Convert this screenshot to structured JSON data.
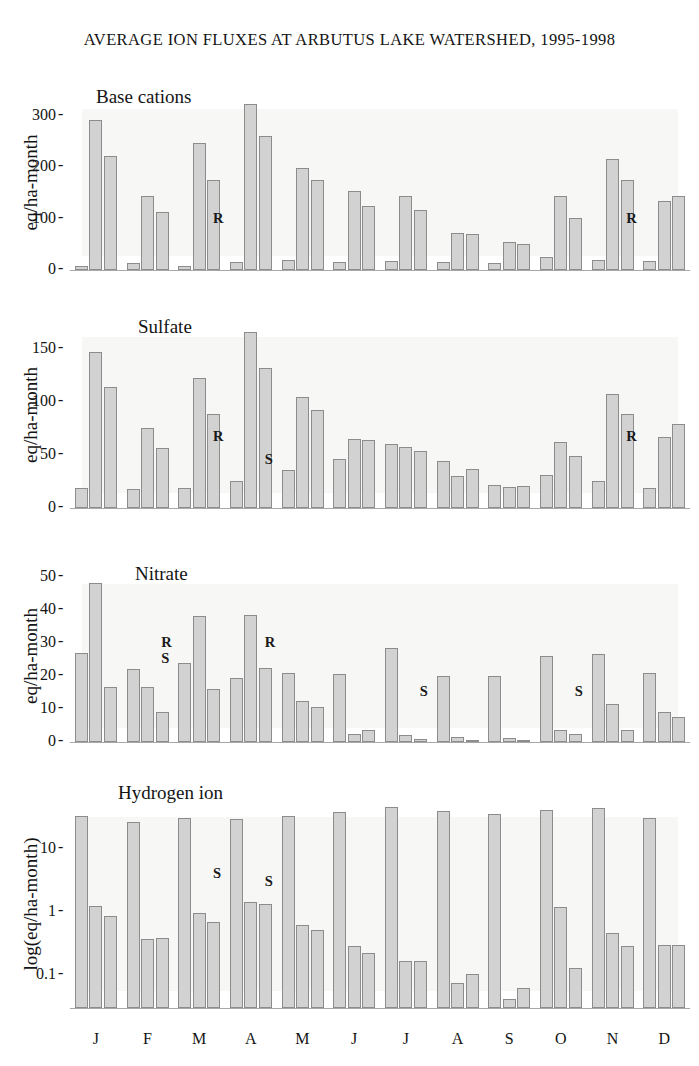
{
  "figure": {
    "title": "AVERAGE ION FLUXES AT ARBUTUS LAKE WATERSHED, 1995-1998",
    "months": [
      "J",
      "F",
      "M",
      "A",
      "M",
      "J",
      "J",
      "A",
      "S",
      "O",
      "N",
      "D"
    ],
    "series_names": [
      "Precipitation",
      "Throughfall",
      "Streamwater"
    ],
    "bar_fill": "#d2d2d2",
    "bar_stroke": "#8c8c8c",
    "shade_color": "#f1f0ee"
  },
  "chart_data": [
    {
      "type": "bar",
      "title": "Base cations",
      "ylabel": "eq/ha-month",
      "xlabel": "",
      "scale": "linear",
      "ylim": [
        0,
        340
      ],
      "yticks": [
        0,
        100,
        200,
        300
      ],
      "ytick_labels": [
        "0",
        "100",
        "200",
        "300"
      ],
      "categories": [
        "J",
        "F",
        "M",
        "A",
        "M",
        "J",
        "J",
        "A",
        "S",
        "O",
        "N",
        "D"
      ],
      "series": [
        {
          "name": "bar1",
          "values": [
            8,
            14,
            8,
            15,
            19,
            16,
            18,
            15,
            14,
            25,
            19,
            18
          ]
        },
        {
          "name": "bar2",
          "values": [
            292,
            143,
            246,
            322,
            199,
            154,
            144,
            71,
            54,
            143,
            216,
            134
          ]
        },
        {
          "name": "bar3",
          "values": [
            221,
            112,
            174,
            260,
            175,
            124,
            116,
            70,
            50,
            102,
            174,
            143
          ]
        }
      ],
      "annotations": [
        {
          "text": "R",
          "category": "M",
          "value": 100
        },
        {
          "text": "R",
          "category": "N",
          "value": 100
        }
      ],
      "grid": false,
      "legend": "none"
    },
    {
      "type": "bar",
      "title": "Sulfate",
      "ylabel": "eq/ha-month",
      "xlabel": "",
      "scale": "linear",
      "ylim": [
        0,
        175
      ],
      "yticks": [
        0,
        50,
        100,
        150
      ],
      "ytick_labels": [
        "0",
        "50",
        "100",
        "150"
      ],
      "categories": [
        "J",
        "F",
        "M",
        "A",
        "M",
        "J",
        "J",
        "A",
        "S",
        "O",
        "N",
        "D"
      ],
      "series": [
        {
          "name": "bar1",
          "values": [
            19,
            18,
            19,
            25,
            36,
            46,
            60,
            44,
            22,
            31,
            25,
            19
          ]
        },
        {
          "name": "bar2",
          "values": [
            147,
            75,
            122,
            166,
            104,
            65,
            57,
            30,
            20,
            62,
            107,
            67
          ]
        },
        {
          "name": "bar3",
          "values": [
            114,
            56,
            88,
            132,
            92,
            64,
            54,
            37,
            21,
            49,
            88,
            79
          ]
        }
      ],
      "annotations": [
        {
          "text": "R",
          "category": "M",
          "value": 67
        },
        {
          "text": "S",
          "category": "A",
          "value": 45
        },
        {
          "text": "R",
          "category": "N",
          "value": 67
        }
      ],
      "grid": false,
      "legend": "none"
    },
    {
      "type": "bar",
      "title": "Nitrate",
      "ylabel": "eq/ha-month",
      "xlabel": "",
      "scale": "linear",
      "ylim": [
        0,
        52
      ],
      "yticks": [
        0,
        10,
        20,
        30,
        40,
        50
      ],
      "ytick_labels": [
        "0",
        "10",
        "20",
        "30",
        "40",
        "50"
      ],
      "categories": [
        "J",
        "F",
        "M",
        "A",
        "M",
        "J",
        "J",
        "A",
        "S",
        "O",
        "N",
        "D"
      ],
      "series": [
        {
          "name": "bar1",
          "values": [
            27,
            22,
            24,
            19.5,
            21,
            20.5,
            28.5,
            20,
            20,
            26,
            26.5,
            21
          ]
        },
        {
          "name": "bar2",
          "values": [
            48,
            16.5,
            38,
            38.5,
            12.5,
            2.5,
            2.0,
            1.5,
            1.2,
            3.5,
            11.5,
            9
          ]
        },
        {
          "name": "bar3",
          "values": [
            16.5,
            9,
            16,
            22.5,
            10.5,
            3.5,
            1.0,
            0.6,
            0.5,
            2.3,
            3.5,
            7.5
          ]
        }
      ],
      "annotations": [
        {
          "text": "R",
          "category": "F",
          "value": 30
        },
        {
          "text": "S",
          "category": "F",
          "value": 25
        },
        {
          "text": "R",
          "category": "A",
          "value": 30
        },
        {
          "text": "S",
          "category": "J2",
          "value": 15
        },
        {
          "text": "S",
          "category": "O",
          "value": 15
        }
      ],
      "grid": false,
      "legend": "none"
    },
    {
      "type": "bar",
      "title": "Hydrogen ion",
      "ylabel": "log(eq/ha-month)",
      "xlabel": "",
      "scale": "log",
      "ylim": [
        0.03,
        60
      ],
      "yticks": [
        0.1,
        1,
        10
      ],
      "ytick_labels": [
        "0.1",
        "1",
        "10"
      ],
      "categories": [
        "J",
        "F",
        "M",
        "A",
        "M",
        "J",
        "J",
        "A",
        "S",
        "O",
        "N",
        "D"
      ],
      "series": [
        {
          "name": "bar1",
          "values": [
            33,
            27,
            31,
            30,
            34,
            38,
            46,
            40,
            36,
            42,
            45,
            31
          ]
        },
        {
          "name": "bar2",
          "values": [
            1.25,
            0.38,
            0.97,
            1.45,
            0.62,
            0.29,
            0.17,
            0.075,
            0.041,
            1.2,
            0.47,
            0.3
          ]
        },
        {
          "name": "bar3",
          "values": [
            0.88,
            0.39,
            0.7,
            1.35,
            0.52,
            0.22,
            0.165,
            0.105,
            0.062,
            0.13,
            0.29,
            0.3
          ]
        }
      ],
      "annotations": [
        {
          "text": "S",
          "category": "M",
          "value": 4
        },
        {
          "text": "S",
          "category": "A",
          "value": 3
        }
      ],
      "grid": false,
      "legend": "none"
    }
  ]
}
